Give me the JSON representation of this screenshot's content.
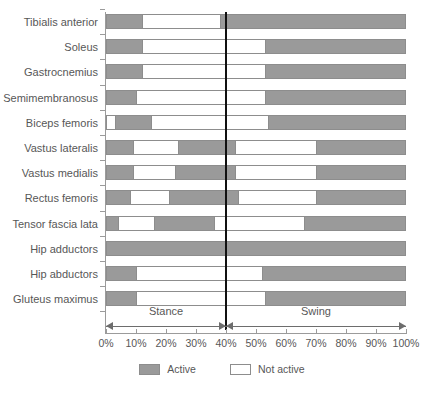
{
  "chart_data": {
    "type": "bar",
    "title": "",
    "subtitle": "",
    "xlabel": "",
    "ylabel": "",
    "xlim": [
      0,
      100
    ],
    "xticks": [
      "0%",
      "10%",
      "20%",
      "30%",
      "40%",
      "50%",
      "60%",
      "70%",
      "80%",
      "90%",
      "100%"
    ],
    "xtick_values": [
      0,
      10,
      20,
      30,
      40,
      50,
      60,
      70,
      80,
      90,
      100
    ],
    "grid": false,
    "legend_position": "bottom",
    "legend": [
      {
        "label": "Active",
        "color": "#9a9a9a",
        "key": "active"
      },
      {
        "label": "Not active",
        "color": "#ffffff",
        "key": "inactive"
      }
    ],
    "annotations": [
      {
        "label": "Stance",
        "from": 0,
        "to": 40
      },
      {
        "label": "Swing",
        "from": 40,
        "to": 100
      }
    ],
    "divider_value": 40,
    "categories": [
      "Tibialis anterior",
      "Soleus",
      "Gastrocnemius",
      "Semimembranosus",
      "Biceps femoris",
      "Vastus lateralis",
      "Vastus medialis",
      "Rectus femoris",
      "Tensor fascia lata",
      "Hip adductors",
      "Hip abductors",
      "Gluteus maximus"
    ],
    "rows": [
      {
        "label": "Tibialis anterior",
        "segments": [
          {
            "state": "active",
            "from": 0,
            "to": 12
          },
          {
            "state": "inactive",
            "from": 12,
            "to": 38
          },
          {
            "state": "active",
            "from": 38,
            "to": 100
          }
        ]
      },
      {
        "label": "Soleus",
        "segments": [
          {
            "state": "active",
            "from": 0,
            "to": 12
          },
          {
            "state": "inactive",
            "from": 12,
            "to": 53
          },
          {
            "state": "active",
            "from": 53,
            "to": 100
          }
        ]
      },
      {
        "label": "Gastrocnemius",
        "segments": [
          {
            "state": "active",
            "from": 0,
            "to": 12
          },
          {
            "state": "inactive",
            "from": 12,
            "to": 53
          },
          {
            "state": "active",
            "from": 53,
            "to": 100
          }
        ]
      },
      {
        "label": "Semimembranosus",
        "segments": [
          {
            "state": "active",
            "from": 0,
            "to": 10
          },
          {
            "state": "inactive",
            "from": 10,
            "to": 53
          },
          {
            "state": "active",
            "from": 53,
            "to": 100
          }
        ]
      },
      {
        "label": "Biceps femoris",
        "segments": [
          {
            "state": "inactive",
            "from": 0,
            "to": 3
          },
          {
            "state": "active",
            "from": 3,
            "to": 15
          },
          {
            "state": "inactive",
            "from": 15,
            "to": 54
          },
          {
            "state": "active",
            "from": 54,
            "to": 100
          }
        ]
      },
      {
        "label": "Vastus lateralis",
        "segments": [
          {
            "state": "active",
            "from": 0,
            "to": 9
          },
          {
            "state": "inactive",
            "from": 9,
            "to": 24
          },
          {
            "state": "active",
            "from": 24,
            "to": 43
          },
          {
            "state": "inactive",
            "from": 43,
            "to": 70
          },
          {
            "state": "active",
            "from": 70,
            "to": 100
          }
        ]
      },
      {
        "label": "Vastus medialis",
        "segments": [
          {
            "state": "active",
            "from": 0,
            "to": 9
          },
          {
            "state": "inactive",
            "from": 9,
            "to": 23
          },
          {
            "state": "active",
            "from": 23,
            "to": 43
          },
          {
            "state": "inactive",
            "from": 43,
            "to": 70
          },
          {
            "state": "active",
            "from": 70,
            "to": 100
          }
        ]
      },
      {
        "label": "Rectus femoris",
        "segments": [
          {
            "state": "active",
            "from": 0,
            "to": 8
          },
          {
            "state": "inactive",
            "from": 8,
            "to": 21
          },
          {
            "state": "active",
            "from": 21,
            "to": 44
          },
          {
            "state": "inactive",
            "from": 44,
            "to": 70
          },
          {
            "state": "active",
            "from": 70,
            "to": 100
          }
        ]
      },
      {
        "label": "Tensor fascia lata",
        "segments": [
          {
            "state": "active",
            "from": 0,
            "to": 4
          },
          {
            "state": "inactive",
            "from": 4,
            "to": 16
          },
          {
            "state": "active",
            "from": 16,
            "to": 36
          },
          {
            "state": "inactive",
            "from": 36,
            "to": 66
          },
          {
            "state": "active",
            "from": 66,
            "to": 100
          }
        ]
      },
      {
        "label": "Hip adductors",
        "segments": [
          {
            "state": "active",
            "from": 0,
            "to": 100
          }
        ]
      },
      {
        "label": "Hip abductors",
        "segments": [
          {
            "state": "active",
            "from": 0,
            "to": 10
          },
          {
            "state": "inactive",
            "from": 10,
            "to": 52
          },
          {
            "state": "active",
            "from": 52,
            "to": 100
          }
        ]
      },
      {
        "label": "Gluteus maximus",
        "segments": [
          {
            "state": "active",
            "from": 0,
            "to": 10
          },
          {
            "state": "inactive",
            "from": 10,
            "to": 53
          },
          {
            "state": "active",
            "from": 53,
            "to": 100
          }
        ]
      }
    ]
  },
  "colors": {
    "active": "#9a9a9a",
    "inactive": "#ffffff",
    "axis": "#9b9b9b",
    "border": "#8d8d8d",
    "divider": "#111111",
    "text": "#575757"
  }
}
